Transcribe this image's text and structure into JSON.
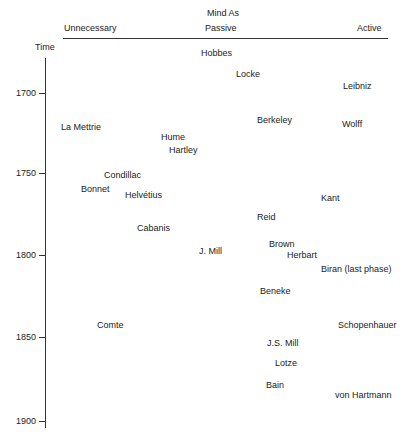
{
  "header": {
    "title_line1": "Mind As",
    "col_unnecessary": "Unnecessary",
    "col_passive": "Passive",
    "col_active": "Active"
  },
  "axis": {
    "label": "Time",
    "ticks": [
      "1700",
      "1750",
      "1800",
      "1850",
      "1900"
    ]
  },
  "thinkers": [
    {
      "name": "Hobbes",
      "category": "Passive",
      "year_approx": 1680
    },
    {
      "name": "Locke",
      "category": "Passive",
      "year_approx": 1690
    },
    {
      "name": "Leibniz",
      "category": "Active",
      "year_approx": 1697
    },
    {
      "name": "La Mettrie",
      "category": "Unnecessary",
      "year_approx": 1720
    },
    {
      "name": "Berkeley",
      "category": "Passive",
      "year_approx": 1717
    },
    {
      "name": "Wolff",
      "category": "Active",
      "year_approx": 1719
    },
    {
      "name": "Hume",
      "category": "Passive",
      "year_approx": 1728
    },
    {
      "name": "Hartley",
      "category": "Passive",
      "year_approx": 1735
    },
    {
      "name": "Condillac",
      "category": "Unnecessary",
      "year_approx": 1751
    },
    {
      "name": "Bonnet",
      "category": "Unnecessary",
      "year_approx": 1759
    },
    {
      "name": "Helvétius",
      "category": "Unnecessary",
      "year_approx": 1762
    },
    {
      "name": "Kant",
      "category": "Active",
      "year_approx": 1765
    },
    {
      "name": "Reid",
      "category": "Passive",
      "year_approx": 1777
    },
    {
      "name": "Cabanis",
      "category": "Unnecessary",
      "year_approx": 1783
    },
    {
      "name": "Brown",
      "category": "Passive",
      "year_approx": 1791
    },
    {
      "name": "J. Mill",
      "category": "Passive",
      "year_approx": 1797
    },
    {
      "name": "Herbart",
      "category": "Passive",
      "year_approx": 1800
    },
    {
      "name": "Biran (last phase)",
      "category": "Active",
      "year_approx": 1809
    },
    {
      "name": "Beneke",
      "category": "Passive",
      "year_approx": 1823
    },
    {
      "name": "Comte",
      "category": "Unnecessary",
      "year_approx": 1842
    },
    {
      "name": "Schopenhauer",
      "category": "Active",
      "year_approx": 1843
    },
    {
      "name": "J.S. Mill",
      "category": "Passive",
      "year_approx": 1853
    },
    {
      "name": "Lotze",
      "category": "Passive",
      "year_approx": 1864
    },
    {
      "name": "Bain",
      "category": "Passive",
      "year_approx": 1876
    },
    {
      "name": "von Hartmann",
      "category": "Active",
      "year_approx": 1883
    }
  ]
}
